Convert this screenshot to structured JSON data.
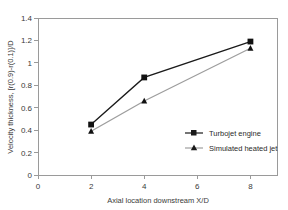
{
  "chart_data": {
    "type": "line",
    "title": "",
    "xlabel": "Axial location downstream X/D",
    "ylabel": "Velocity thickness, [r(0.9)-r(0.1)]/D",
    "x": [
      2,
      4,
      8
    ],
    "xlim": [
      0,
      9
    ],
    "ylim": [
      0,
      1.4
    ],
    "xticks": [
      "0",
      "2",
      "4",
      "6",
      "8"
    ],
    "xtick_values": [
      0,
      2,
      4,
      6,
      8
    ],
    "yticks": [
      "0",
      "0.2",
      "0.4",
      "0.6",
      "0.8",
      "1",
      "1.2",
      "1.4"
    ],
    "ytick_values": [
      0,
      0.2,
      0.4,
      0.6,
      0.8,
      1.0,
      1.2,
      1.4
    ],
    "grid": false,
    "legend_position": "inside-lower-right",
    "series": [
      {
        "name": "Turbojet engine",
        "marker": "square",
        "color": "#1a1a1a",
        "values": [
          0.45,
          0.87,
          1.19
        ]
      },
      {
        "name": "Simulated heated jet",
        "marker": "triangle",
        "color": "#9e9e9e",
        "values": [
          0.39,
          0.66,
          1.13
        ]
      }
    ]
  },
  "legend": {
    "items": [
      {
        "label": "Turbojet engine"
      },
      {
        "label": "Simulated heated jet"
      }
    ]
  },
  "colors": {
    "series_1": "#1a1a1a",
    "series_2": "#9e9e9e",
    "frame": "#9a9a9a",
    "background": "#ffffff"
  }
}
